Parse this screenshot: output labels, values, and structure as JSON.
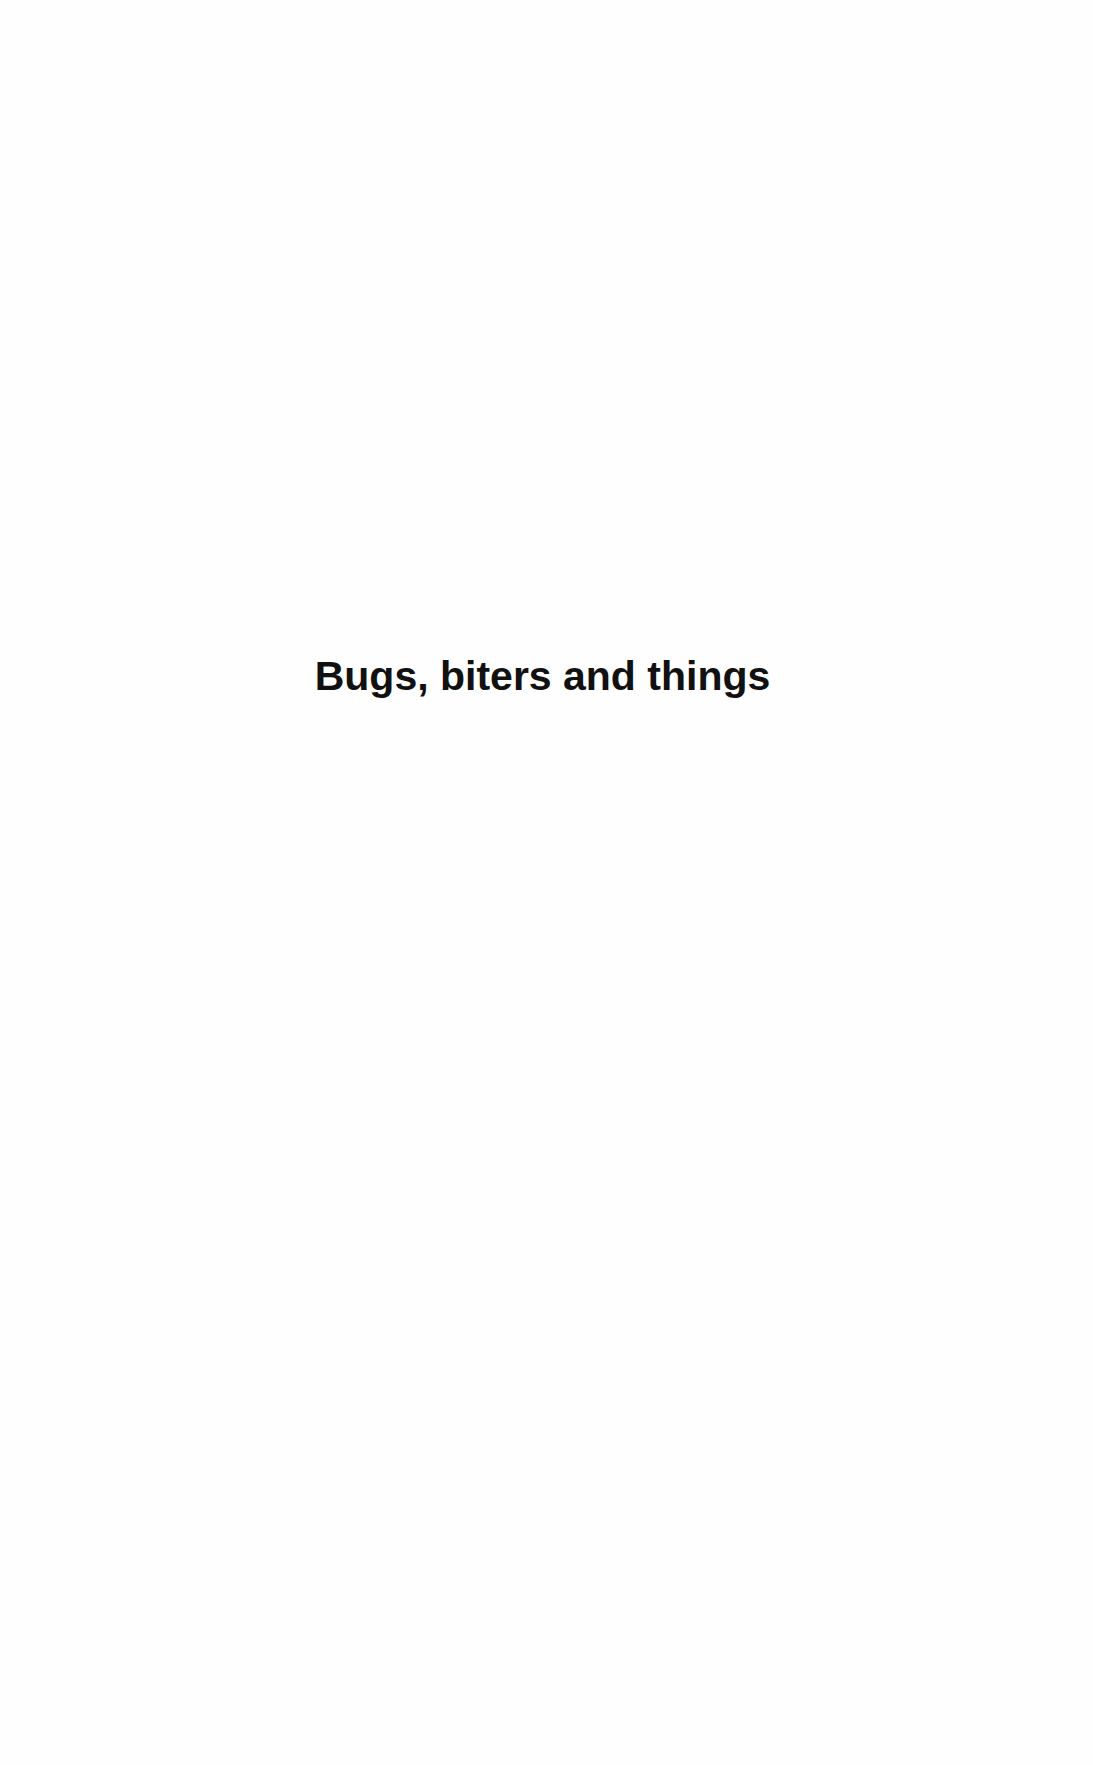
{
  "page": {
    "title": "Bugs, biters and things"
  }
}
